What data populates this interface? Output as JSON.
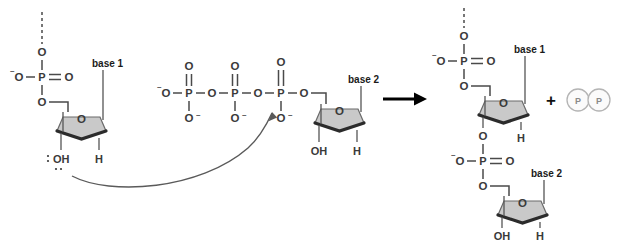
{
  "figure": {
    "type": "reaction-mechanism",
    "background_color": "#ffffff",
    "ring_fill_color": "#c9c9c9",
    "bond_color": "#4a4a4a",
    "label_color": "#1a1a1a",
    "byproduct_color": "#8a8a8a"
  },
  "reactants": {
    "growing_strand": {
      "name": "growing-dna-strand",
      "continuation_bond": "dashed",
      "phosphate": {
        "p": "P",
        "double_bond_o": "O",
        "top_o": "O",
        "left_o": "O",
        "left_charge": "–",
        "bottom_o": "O"
      },
      "sugar": {
        "ring_o": "O",
        "base_label": "base  1",
        "three_prime": "OH",
        "two_prime": "H",
        "lone_pairs": true
      }
    },
    "incoming_nucleotide": {
      "name": "incoming-dntp",
      "triphosphate": [
        {
          "position": "gamma",
          "p": "P",
          "double_bond_o": "O",
          "bottom_o": "O",
          "bottom_charge": "–",
          "terminal_o": "O",
          "terminal_charge": "–"
        },
        {
          "position": "beta",
          "p": "P",
          "double_bond_o": "O",
          "bottom_o": "O",
          "bottom_charge": "–"
        },
        {
          "position": "alpha",
          "p": "P",
          "double_bond_o": "O",
          "bottom_o": "O",
          "bottom_charge": "–"
        }
      ],
      "bridging_o": "O",
      "sugar": {
        "ring_o": "O",
        "base_label": "base 2",
        "three_prime": "OH",
        "two_prime": "H"
      }
    }
  },
  "mechanism": {
    "curved_arrow": {
      "name": "nucleophilic-attack-arrow",
      "from": "3'-OH oxygen lone pair",
      "to": "alpha-phosphorus"
    }
  },
  "reaction_arrow": {
    "name": "reaction-arrow",
    "direction": "right"
  },
  "products": {
    "elongated_strand": {
      "name": "elongated-dna-strand",
      "continuation_bond": "dashed",
      "upper_phosphate": {
        "p": "P",
        "double_bond_o": "O",
        "top_o": "O",
        "left_o": "O",
        "left_charge": "–",
        "bottom_o": "O"
      },
      "upper_sugar": {
        "ring_o": "O",
        "base_label": "base 1",
        "three_prime_o": "O",
        "two_prime": "H"
      },
      "new_phosphate": {
        "p": "P",
        "double_bond_o": "O",
        "top_o": "O",
        "left_o": "O",
        "left_charge": "–",
        "bottom_o": "O"
      },
      "lower_sugar": {
        "ring_o": "O",
        "base_label": "base 2",
        "three_prime": "OH",
        "two_prime": "H"
      }
    },
    "plus_sign": "+",
    "pyrophosphate": {
      "name": "pyrophosphate-byproduct",
      "circles": [
        "P",
        "P"
      ]
    }
  }
}
